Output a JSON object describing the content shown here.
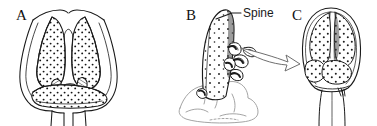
{
  "figure": {
    "kind": "scientific-line-illustration",
    "background_color": "#ffffff",
    "ink_color": "#1a1a1a",
    "width": 377,
    "height": 126,
    "panels": [
      {
        "id": "A",
        "label": "A",
        "description": "Frontal view of paired stippled lobes separated by a median cleft, enclosed by a thin outer capsule outline, with a transverse stippled lower lobe and two short basal stalks."
      },
      {
        "id": "B",
        "label": "B",
        "description": "Lateral view of a single tall tapering stippled spine arising from a pale lumpy basal mass with small knobbed projections."
      },
      {
        "id": "C",
        "label": "C",
        "description": "Ovoid capsule containing stippled lobes with a median groove, narrowing below into a slender stalk."
      }
    ],
    "annotations": [
      {
        "id": "spine",
        "text": "Spine",
        "target_panel": "B",
        "leader": "line from spine tip up-right to text"
      }
    ],
    "arrow": {
      "id": "transition-arrow",
      "from_panel": "B",
      "to_panel": "C",
      "style": "hollow outlined curved arrow",
      "direction": "right"
    }
  }
}
